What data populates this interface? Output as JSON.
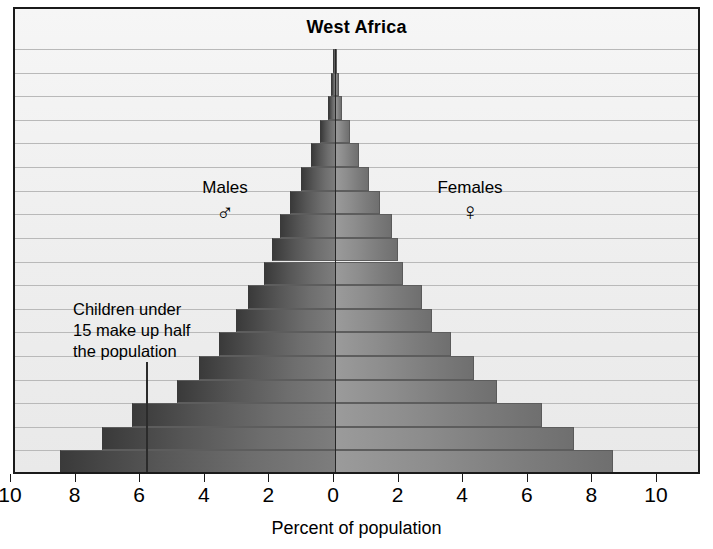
{
  "chart_data": {
    "type": "bar",
    "subtype": "population-pyramid",
    "title": "West Africa",
    "xlabel": "Percent of population",
    "ylabel": "",
    "xlim": [
      -10,
      10
    ],
    "xticks": [
      10,
      8,
      6,
      4,
      2,
      0,
      2,
      4,
      6,
      8,
      10
    ],
    "xtick_labels": [
      "10",
      "8",
      "6",
      "4",
      "2",
      "0",
      "2",
      "4",
      "6",
      "8",
      "10"
    ],
    "grid": true,
    "legend_position": "inside-upper",
    "n_bands": 18,
    "categories": [
      "band-18",
      "band-17",
      "band-16",
      "band-15",
      "band-14",
      "band-13",
      "band-12",
      "band-11",
      "band-10",
      "band-9",
      "band-8",
      "band-7",
      "band-6",
      "band-5",
      "band-4",
      "band-3",
      "band-2",
      "band-1"
    ],
    "series": [
      {
        "name": "Males",
        "side": "left",
        "symbol": "♂",
        "values": [
          0.05,
          0.12,
          0.22,
          0.45,
          0.75,
          1.05,
          1.4,
          1.7,
          1.95,
          2.2,
          2.7,
          3.05,
          3.6,
          4.2,
          4.9,
          6.3,
          7.2,
          8.5
        ]
      },
      {
        "name": "Females",
        "side": "right",
        "symbol": "♀",
        "values": [
          0.05,
          0.12,
          0.22,
          0.45,
          0.75,
          1.05,
          1.4,
          1.75,
          1.95,
          2.1,
          2.7,
          3.0,
          3.6,
          4.3,
          5.0,
          6.4,
          7.4,
          8.6
        ]
      }
    ],
    "annotations": [
      {
        "name": "children-note",
        "text": "Children under 15 make up half the population",
        "lines": [
          "Children under",
          "15 make up half",
          "the population"
        ],
        "leader_line": true
      }
    ],
    "colors": {
      "male_outer": "#3a3a3a",
      "male_inner": "#7d7d7d",
      "female_inner": "#9b9b9b",
      "female_outer": "#6f6f6f",
      "background": "#f2f2f2",
      "gridline": "#b9b9b9",
      "frame": "#1a1a1a",
      "text": "#000000"
    }
  },
  "labels": {
    "males": "Males",
    "males_symbol": "♂",
    "females": "Females",
    "females_symbol": "♀"
  },
  "annotation": {
    "line1": "Children under",
    "line2": "15 make up half",
    "line3": "the population"
  }
}
